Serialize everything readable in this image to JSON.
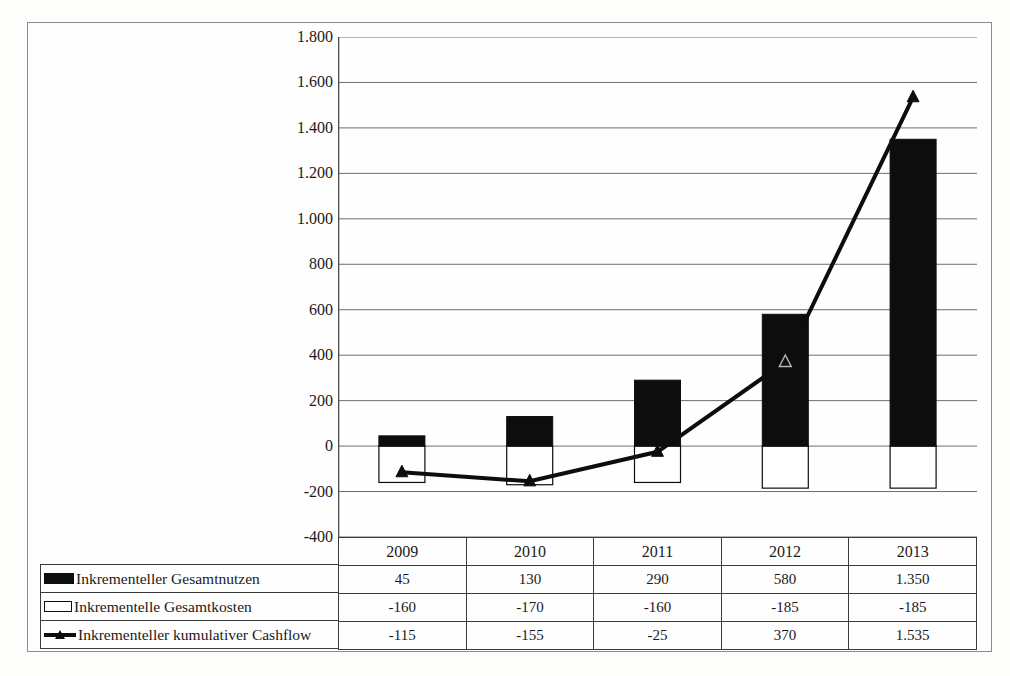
{
  "chart_data": {
    "type": "bar",
    "title": "",
    "subtitle": "",
    "xlabel": "",
    "ylabel": "",
    "categories": [
      "2009",
      "2010",
      "2011",
      "2012",
      "2013"
    ],
    "ylim": [
      -400,
      1800
    ],
    "ytick_step": 200,
    "ytick_labels": [
      "1.800",
      "1.600",
      "1.400",
      "1.200",
      "1.000",
      "800",
      "600",
      "400",
      "200",
      "0",
      "-200",
      "-400"
    ],
    "ytick_values": [
      1800,
      1600,
      1400,
      1200,
      1000,
      800,
      600,
      400,
      200,
      0,
      -200,
      -400
    ],
    "grid": true,
    "legend_position": "table-left",
    "series": [
      {
        "name": "Inkrementeller Gesamtnutzen",
        "type": "bar",
        "marker": "filled-rect",
        "color": "#0d0d0d",
        "values": [
          45,
          130,
          290,
          580,
          1350
        ],
        "labels": [
          "45",
          "130",
          "290",
          "580",
          "1.350"
        ]
      },
      {
        "name": "Inkrementelle Gesamtkosten",
        "type": "bar",
        "marker": "hollow-rect",
        "color": "#ffffff",
        "border_color": "#0d0d0d",
        "values": [
          -160,
          -170,
          -160,
          -185,
          -185
        ],
        "labels": [
          "-160",
          "-170",
          "-160",
          "-185",
          "-185"
        ]
      },
      {
        "name": "Inkrementeller kumulativer Cashflow",
        "type": "line",
        "marker": "triangle",
        "color": "#0d0d0d",
        "values": [
          -115,
          -155,
          -25,
          370,
          1535
        ],
        "labels": [
          "-115",
          "-155",
          "-25",
          "370",
          "1.535"
        ]
      }
    ]
  },
  "table": {
    "year_row": [
      "2009",
      "2010",
      "2011",
      "2012",
      "2013"
    ],
    "rows": [
      {
        "label": "Inkrementeller Gesamtnutzen",
        "swatch": "filled-rect-icon",
        "cells": [
          "45",
          "130",
          "290",
          "580",
          "1.350"
        ]
      },
      {
        "label": "Inkrementelle Gesamtkosten",
        "swatch": "hollow-rect-icon",
        "cells": [
          "-160",
          "-170",
          "-160",
          "-185",
          "-185"
        ]
      },
      {
        "label": "Inkrementeller kumulativer Cashflow",
        "swatch": "line-triangle-icon",
        "cells": [
          "-115",
          "-155",
          "-25",
          "370",
          "1.535"
        ]
      }
    ]
  },
  "colors": {
    "benefit": "#0d0d0d",
    "cost": "#ffffff",
    "cashflow": "#0d0d0d",
    "grid": "#6e6e6e",
    "frame": "#8c8c8c"
  }
}
